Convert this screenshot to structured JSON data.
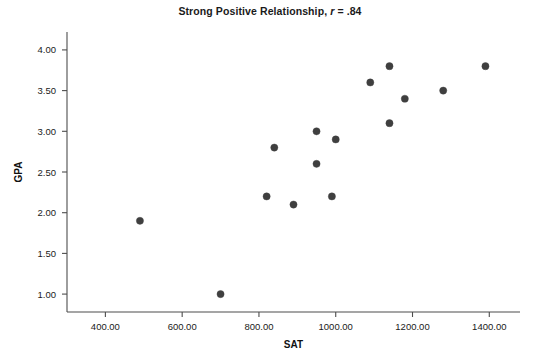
{
  "chart_data": {
    "type": "scatter",
    "title": "Strong Positive Relationship, r = .84",
    "title_prefix": "Strong Positive Relationship, ",
    "title_stat_symbol": "r",
    "title_stat_value": " = .84",
    "xlabel": "SAT",
    "ylabel": "GPA",
    "xlim": [
      300,
      1480
    ],
    "ylim": [
      0.78,
      4.22
    ],
    "xticks": [
      400,
      600,
      800,
      1000,
      1200,
      1400
    ],
    "xtick_labels": [
      "400.00",
      "600.00",
      "800.00",
      "1000.00",
      "1200.00",
      "1400.00"
    ],
    "yticks": [
      1.0,
      1.5,
      2.0,
      2.5,
      3.0,
      3.5,
      4.0
    ],
    "ytick_labels": [
      "1.00",
      "1.50",
      "2.00",
      "2.50",
      "3.00",
      "3.50",
      "4.00"
    ],
    "grid": false,
    "legend": "none",
    "marker_color": "#3f3f3f",
    "axis_color": "#4d4d4d",
    "correlation": 0.84,
    "n_points": 15,
    "points": [
      {
        "x": 490,
        "y": 1.9
      },
      {
        "x": 700,
        "y": 1.0
      },
      {
        "x": 820,
        "y": 2.2
      },
      {
        "x": 840,
        "y": 2.8
      },
      {
        "x": 890,
        "y": 2.1
      },
      {
        "x": 950,
        "y": 3.0
      },
      {
        "x": 950,
        "y": 2.6
      },
      {
        "x": 990,
        "y": 2.2
      },
      {
        "x": 1000,
        "y": 2.9
      },
      {
        "x": 1090,
        "y": 3.6
      },
      {
        "x": 1140,
        "y": 3.8
      },
      {
        "x": 1140,
        "y": 3.1
      },
      {
        "x": 1180,
        "y": 3.4
      },
      {
        "x": 1280,
        "y": 3.5
      },
      {
        "x": 1390,
        "y": 3.8
      }
    ]
  }
}
